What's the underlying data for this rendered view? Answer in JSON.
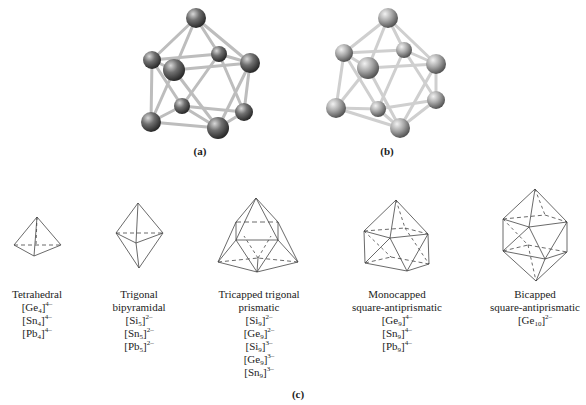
{
  "panels": {
    "a": {
      "label": "(a)",
      "atom_color": "#6e6e6e",
      "bond_color": "#c8c8c8"
    },
    "b": {
      "label": "(b)",
      "atom_color": "#a8a8a8",
      "bond_color": "#d0d0d0"
    },
    "c": {
      "label": "(c)"
    }
  },
  "shapes": [
    {
      "name": "Tetrahedral",
      "name_lines": [
        "Tetrahedral"
      ],
      "formulas": [
        {
          "el": "Ge",
          "n": "4",
          "charge": "4–"
        },
        {
          "el": "Sn",
          "n": "4",
          "charge": "4–"
        },
        {
          "el": "Pb",
          "n": "4",
          "charge": "4–"
        }
      ]
    },
    {
      "name": "Trigonal bipyramidal",
      "name_lines": [
        "Trigonal",
        "bipyramidal"
      ],
      "formulas": [
        {
          "el": "Si",
          "n": "5",
          "charge": "2–"
        },
        {
          "el": "Sn",
          "n": "5",
          "charge": "2–"
        },
        {
          "el": "Pb",
          "n": "5",
          "charge": "2–"
        }
      ]
    },
    {
      "name": "Tricapped trigonal prismatic",
      "name_lines": [
        "Tricapped trigonal",
        "prismatic"
      ],
      "formulas": [
        {
          "el": "Si",
          "n": "9",
          "charge": "2–"
        },
        {
          "el": "Ge",
          "n": "9",
          "charge": "2–"
        },
        {
          "el": "Si",
          "n": "9",
          "charge": "3–"
        },
        {
          "el": "Ge",
          "n": "9",
          "charge": "3–"
        },
        {
          "el": "Sn",
          "n": "9",
          "charge": "3–"
        }
      ]
    },
    {
      "name": "Monocapped square-antiprismatic",
      "name_lines": [
        "Monocapped",
        "square-antiprismatic"
      ],
      "formulas": [
        {
          "el": "Ge",
          "n": "9",
          "charge": "4–"
        },
        {
          "el": "Sn",
          "n": "9",
          "charge": "4–"
        },
        {
          "el": "Pb",
          "n": "9",
          "charge": "4–"
        }
      ]
    },
    {
      "name": "Bicapped square-antiprismatic",
      "name_lines": [
        "Bicapped",
        "square-antiprismatic"
      ],
      "formulas": [
        {
          "el": "Ge",
          "n": "10",
          "charge": "2–"
        }
      ]
    }
  ],
  "line_color": "#333333"
}
